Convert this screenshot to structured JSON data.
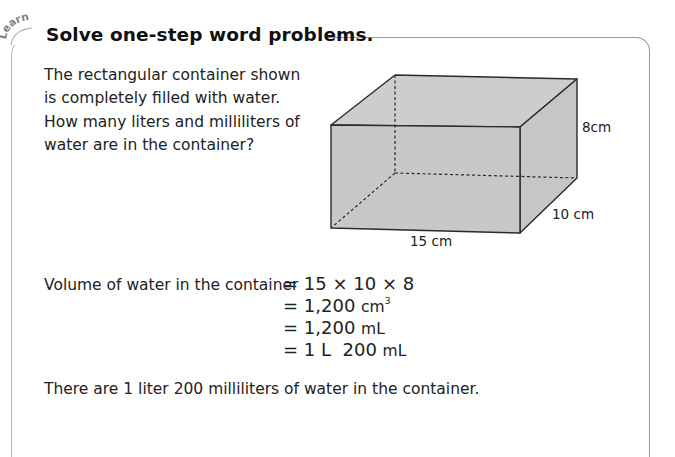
{
  "section": {
    "tag": "Learn",
    "title": "Solve one-step word problems."
  },
  "problem": {
    "lines": [
      "The rectangular container shown",
      "is completely filled with water.",
      "How many liters and milliliters of",
      "water are in the container?"
    ]
  },
  "figure": {
    "shape": "rectangular-prism",
    "fill_color": "#c8c8c8",
    "edge_color": "#2a2a2a",
    "labels": {
      "length": "15 cm",
      "width": "10 cm",
      "height": "8cm"
    }
  },
  "solution": {
    "label": "Volume of water in the container",
    "steps": [
      {
        "eq": "=",
        "value": "15 × 10 × 8",
        "unit": "",
        "sup": ""
      },
      {
        "eq": "=",
        "value": "1,200",
        "unit": "cm",
        "sup": "3"
      },
      {
        "eq": "=",
        "value": "1,200",
        "unit": "mL",
        "sup": ""
      },
      {
        "eq": "=",
        "value": "1 L  200",
        "unit": "mL",
        "sup": ""
      }
    ],
    "conclusion": "There are 1 liter 200 milliliters of water in the container."
  }
}
